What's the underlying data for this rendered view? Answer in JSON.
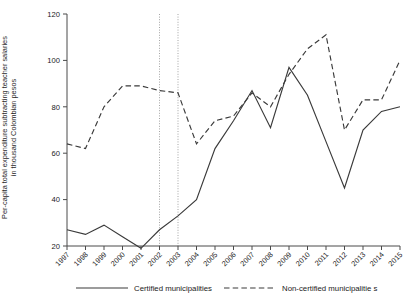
{
  "chart_data": {
    "type": "line",
    "title": "",
    "xlabel": "",
    "ylabel": "Per-capita total expenditure subtracting teacher salaries\nin thousand Colombian pesos",
    "ylabel_line1": "Per-capita total expenditure subtracting teacher salaries",
    "ylabel_line2": "in thousand Colombian pesos",
    "categories": [
      "1997",
      "1998",
      "1999",
      "2000",
      "2001",
      "2002",
      "2003",
      "2004",
      "2005",
      "2006",
      "2007",
      "2008",
      "2009",
      "2010",
      "2011",
      "2012",
      "2013",
      "2014",
      "2015"
    ],
    "x": [
      1997,
      1998,
      1999,
      2000,
      2001,
      2002,
      2003,
      2004,
      2005,
      2006,
      2007,
      2008,
      2009,
      2010,
      2011,
      2012,
      2013,
      2014,
      2015
    ],
    "series": [
      {
        "name": "Certified municipalities",
        "style": "solid",
        "color": "#3a3a3a",
        "values": [
          27,
          25,
          29,
          24,
          19,
          27,
          33,
          40,
          62,
          74,
          87,
          71,
          97,
          85,
          65,
          45,
          70,
          78,
          80
        ]
      },
      {
        "name": "Non-certified municipalitie s",
        "style": "dashed",
        "color": "#3a3a3a",
        "values": [
          64,
          62,
          80,
          89,
          89,
          87,
          86,
          64,
          74,
          76,
          86,
          80,
          94,
          105,
          111,
          70,
          83,
          83,
          100
        ]
      }
    ],
    "ylim": [
      20,
      120
    ],
    "yticks": [
      20,
      40,
      60,
      80,
      100,
      120
    ],
    "ytick_labels": [
      "20",
      "40",
      "60",
      "80",
      "100",
      "120"
    ],
    "xlim": [
      1997,
      2015
    ],
    "grid": false,
    "legend_position": "bottom",
    "reference_lines": [
      {
        "x": 2002,
        "style": "dotted",
        "color": "#9a9a9a"
      },
      {
        "x": 2003,
        "style": "dotted",
        "color": "#9a9a9a"
      }
    ]
  },
  "legend": {
    "items": [
      {
        "label": "Certified municipalities",
        "style": "solid"
      },
      {
        "label": "Non-certified municipalitie s",
        "style": "dashed"
      }
    ]
  },
  "colors": {
    "line": "#3a3a3a",
    "axis": "#4a4a4a",
    "refline": "#9a9a9a",
    "text": "#1a1a1a",
    "background": "#ffffff"
  }
}
